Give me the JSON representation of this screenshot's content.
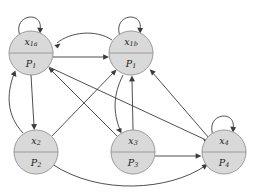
{
  "diagram": {
    "type": "directed-graph",
    "background_color": "#ffffff",
    "node_fill_color": "#d9d9d9",
    "node_stroke_color": "#9a9a9a",
    "edge_color": "#3b3b3b",
    "node_radius": 22,
    "nodes": [
      {
        "id": "x1a",
        "cx": 31,
        "cy": 53,
        "top_label": "x",
        "top_sub": "1a",
        "bottom_label": "P",
        "bottom_sub": "1"
      },
      {
        "id": "x1b",
        "cx": 131,
        "cy": 53,
        "top_label": "x",
        "top_sub": "1b",
        "bottom_label": "P",
        "bottom_sub": "1"
      },
      {
        "id": "x2",
        "cx": 36,
        "cy": 152,
        "top_label": "x",
        "top_sub": "2",
        "bottom_label": "P",
        "bottom_sub": "2"
      },
      {
        "id": "x3",
        "cx": 133,
        "cy": 152,
        "top_label": "x",
        "top_sub": "3",
        "bottom_label": "P",
        "bottom_sub": "3"
      },
      {
        "id": "x4",
        "cx": 224,
        "cy": 152,
        "top_label": "x",
        "top_sub": "4",
        "bottom_label": "P",
        "bottom_sub": "4"
      }
    ],
    "self_loops": [
      "x1a",
      "x1b",
      "x4"
    ],
    "edges": [
      {
        "from": "x1a",
        "to": "x1a",
        "kind": "self-loop"
      },
      {
        "from": "x1b",
        "to": "x1b",
        "kind": "self-loop"
      },
      {
        "from": "x4",
        "to": "x4",
        "kind": "self-loop"
      },
      {
        "from": "x1a",
        "to": "x1b",
        "kind": "straight"
      },
      {
        "from": "x1b",
        "to": "x1a",
        "kind": "curved"
      },
      {
        "from": "x1a",
        "to": "x2",
        "kind": "straight"
      },
      {
        "from": "x2",
        "to": "x1a",
        "kind": "curved"
      },
      {
        "from": "x3",
        "to": "x1a",
        "kind": "straight"
      },
      {
        "from": "x1a",
        "to": "x4",
        "kind": "straight"
      },
      {
        "from": "x1b",
        "to": "x3",
        "kind": "curved"
      },
      {
        "from": "x3",
        "to": "x1b",
        "kind": "straight"
      },
      {
        "from": "x2",
        "to": "x1b",
        "kind": "straight"
      },
      {
        "from": "x4",
        "to": "x1b",
        "kind": "straight"
      },
      {
        "from": "x3",
        "to": "x4",
        "kind": "straight"
      },
      {
        "from": "x2",
        "to": "x4",
        "kind": "curved"
      }
    ]
  }
}
